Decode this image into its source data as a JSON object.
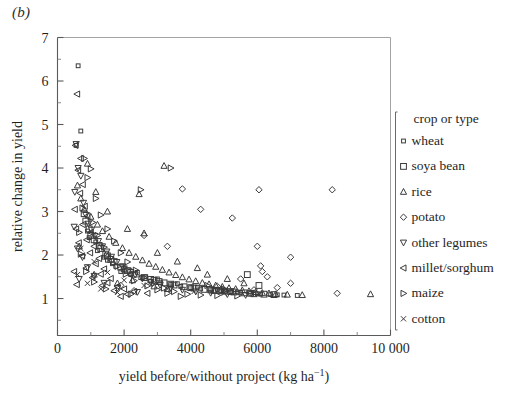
{
  "panel": {
    "label": "(b)"
  },
  "chart_data": {
    "type": "scatter",
    "title": "",
    "panel_label": "(b)",
    "xlabel": "yield before/without project (kg ha⁻¹)",
    "ylabel": "relative change in yield",
    "xlim": [
      0,
      10000
    ],
    "ylim": [
      0.15,
      7
    ],
    "grid": false,
    "legend_position": "right-outside",
    "legend_title": "crop or type",
    "x_ticks": [
      0,
      2000,
      4000,
      6000,
      8000,
      10000
    ],
    "x_tick_labels": [
      "0",
      "2000",
      "4000",
      "6000",
      "8000",
      "10 000"
    ],
    "x_minor_ticks": [
      1000,
      3000,
      5000,
      7000,
      9000
    ],
    "y_ticks": [
      1,
      2,
      3,
      4,
      5,
      6,
      7
    ],
    "y_tick_labels": [
      "1",
      "2",
      "3",
      "4",
      "5",
      "6",
      "7"
    ],
    "y_minor_ticks": [
      0.5,
      1.5,
      2.5,
      3.5,
      4.5,
      5.5,
      6.5
    ],
    "series": [
      {
        "name": "wheat",
        "marker": "small-square",
        "points": [
          [
            620,
            6.35
          ],
          [
            700,
            4.85
          ],
          [
            560,
            4.52
          ],
          [
            900,
            2.55
          ],
          [
            1150,
            2.3
          ],
          [
            1400,
            1.95
          ],
          [
            1650,
            1.8
          ],
          [
            1900,
            1.62
          ],
          [
            2200,
            1.55
          ],
          [
            2500,
            1.48
          ],
          [
            2800,
            1.4
          ],
          [
            3100,
            1.36
          ],
          [
            3400,
            1.32
          ],
          [
            3700,
            1.28
          ],
          [
            4000,
            1.25
          ],
          [
            4300,
            1.22
          ],
          [
            4600,
            1.2
          ],
          [
            4900,
            1.18
          ],
          [
            5200,
            1.16
          ],
          [
            5500,
            1.14
          ],
          [
            5800,
            1.12
          ],
          [
            6100,
            1.1
          ],
          [
            6400,
            1.09
          ],
          [
            6800,
            1.08
          ],
          [
            7200,
            1.07
          ],
          [
            2000,
            1.7
          ],
          [
            2400,
            1.6
          ],
          [
            3000,
            1.45
          ],
          [
            3600,
            1.34
          ],
          [
            4200,
            1.26
          ],
          [
            4800,
            1.21
          ],
          [
            5400,
            1.15
          ],
          [
            6000,
            1.11
          ],
          [
            1200,
            2.1
          ],
          [
            1500,
            1.88
          ],
          [
            950,
            2.4
          ],
          [
            1750,
            1.74
          ],
          [
            2650,
            1.5
          ],
          [
            5050,
            1.17
          ],
          [
            6600,
            1.085
          ]
        ]
      },
      {
        "name": "soya bean",
        "marker": "square",
        "points": [
          [
            800,
            2.95
          ],
          [
            950,
            2.6
          ],
          [
            1100,
            2.35
          ],
          [
            1300,
            2.15
          ],
          [
            1500,
            1.98
          ],
          [
            1700,
            1.85
          ],
          [
            1900,
            1.72
          ],
          [
            2100,
            1.64
          ],
          [
            2300,
            1.56
          ],
          [
            2600,
            1.48
          ],
          [
            2900,
            1.42
          ],
          [
            3200,
            1.36
          ],
          [
            3500,
            1.31
          ],
          [
            3800,
            1.27
          ],
          [
            4100,
            1.24
          ],
          [
            4400,
            1.21
          ],
          [
            4700,
            1.19
          ],
          [
            5000,
            1.17
          ],
          [
            5300,
            1.15
          ],
          [
            5600,
            1.13
          ],
          [
            5900,
            1.11
          ],
          [
            6200,
            1.1
          ],
          [
            6500,
            1.09
          ],
          [
            1000,
            2.45
          ],
          [
            1250,
            2.22
          ],
          [
            1600,
            1.9
          ],
          [
            2000,
            1.68
          ],
          [
            2800,
            1.44
          ],
          [
            3400,
            1.33
          ],
          [
            4000,
            1.25
          ],
          [
            4600,
            1.2
          ],
          [
            5200,
            1.16
          ],
          [
            5800,
            1.12
          ],
          [
            6050,
            1.3
          ],
          [
            5700,
            1.55
          ],
          [
            850,
            2.78
          ],
          [
            1450,
            2.02
          ],
          [
            2200,
            1.6
          ],
          [
            3050,
            1.39
          ],
          [
            4900,
            1.18
          ]
        ]
      },
      {
        "name": "rice",
        "marker": "triangle-up",
        "points": [
          [
            900,
            4.1
          ],
          [
            3200,
            4.05
          ],
          [
            1150,
            3.45
          ],
          [
            2450,
            3.4
          ],
          [
            700,
            3.3
          ],
          [
            800,
            3.05
          ],
          [
            1000,
            2.88
          ],
          [
            1200,
            2.7
          ],
          [
            1350,
            2.55
          ],
          [
            1550,
            2.42
          ],
          [
            1750,
            2.28
          ],
          [
            1950,
            2.16
          ],
          [
            2150,
            2.05
          ],
          [
            2350,
            1.96
          ],
          [
            2550,
            1.88
          ],
          [
            2750,
            1.8
          ],
          [
            2950,
            1.73
          ],
          [
            3150,
            1.66
          ],
          [
            3350,
            1.6
          ],
          [
            3550,
            1.54
          ],
          [
            3750,
            1.49
          ],
          [
            3950,
            1.44
          ],
          [
            4150,
            1.4
          ],
          [
            4350,
            1.36
          ],
          [
            4550,
            1.33
          ],
          [
            4750,
            1.3
          ],
          [
            4950,
            1.27
          ],
          [
            5150,
            1.24
          ],
          [
            5350,
            1.22
          ],
          [
            5550,
            1.19
          ],
          [
            5750,
            1.17
          ],
          [
            5950,
            1.15
          ],
          [
            6150,
            1.13
          ],
          [
            6350,
            1.12
          ],
          [
            6550,
            1.1
          ],
          [
            6900,
            1.09
          ],
          [
            7350,
            1.08
          ],
          [
            9400,
            1.1
          ],
          [
            2600,
            2.5
          ],
          [
            3000,
            2.05
          ],
          [
            3600,
            1.85
          ],
          [
            4200,
            1.7
          ],
          [
            1500,
            3.0
          ],
          [
            2100,
            2.6
          ],
          [
            4500,
            1.55
          ],
          [
            5100,
            1.45
          ],
          [
            5600,
            1.35
          ],
          [
            600,
            3.6
          ],
          [
            1800,
            1.35
          ],
          [
            2900,
            1.28
          ],
          [
            3300,
            1.22
          ],
          [
            4700,
            1.18
          ],
          [
            650,
            2.2
          ],
          [
            1100,
            1.55
          ],
          [
            2250,
            1.42
          ]
        ]
      },
      {
        "name": "potato",
        "marker": "diamond",
        "points": [
          [
            3750,
            3.52
          ],
          [
            6050,
            3.5
          ],
          [
            8250,
            3.5
          ],
          [
            4300,
            3.05
          ],
          [
            5250,
            2.85
          ],
          [
            2600,
            2.45
          ],
          [
            3300,
            2.2
          ],
          [
            6000,
            2.2
          ],
          [
            7000,
            1.95
          ],
          [
            6100,
            1.75
          ],
          [
            6150,
            1.62
          ],
          [
            5500,
            1.45
          ],
          [
            7000,
            1.35
          ],
          [
            6600,
            1.25
          ],
          [
            5900,
            1.2
          ],
          [
            8400,
            1.12
          ],
          [
            1900,
            1.3
          ],
          [
            2300,
            1.18
          ],
          [
            6300,
            1.5
          ],
          [
            4800,
            1.28
          ]
        ]
      },
      {
        "name": "other legumes",
        "marker": "triangle-down",
        "points": [
          [
            560,
            4.55
          ],
          [
            620,
            4.0
          ],
          [
            700,
            3.82
          ],
          [
            780,
            3.2
          ],
          [
            850,
            2.92
          ],
          [
            930,
            2.72
          ],
          [
            1020,
            2.58
          ],
          [
            1120,
            2.44
          ],
          [
            1230,
            2.32
          ],
          [
            1350,
            2.2
          ],
          [
            1480,
            2.08
          ],
          [
            1620,
            1.96
          ],
          [
            1780,
            1.84
          ],
          [
            1950,
            1.74
          ],
          [
            2130,
            1.64
          ],
          [
            2330,
            1.55
          ],
          [
            2550,
            1.46
          ],
          [
            2800,
            1.38
          ],
          [
            3080,
            1.31
          ],
          [
            3400,
            1.25
          ],
          [
            3750,
            1.2
          ],
          [
            4150,
            1.16
          ],
          [
            4600,
            1.13
          ],
          [
            5100,
            1.1
          ],
          [
            5650,
            1.08
          ],
          [
            600,
            2.15
          ],
          [
            750,
            1.95
          ],
          [
            900,
            1.72
          ],
          [
            1100,
            1.52
          ],
          [
            1400,
            1.36
          ],
          [
            1800,
            1.24
          ],
          [
            2400,
            1.15
          ],
          [
            650,
            1.45
          ],
          [
            500,
            2.65
          ],
          [
            520,
            3.45
          ]
        ]
      },
      {
        "name": "millet/sorghum",
        "marker": "triangle-left",
        "points": [
          [
            590,
            5.7
          ],
          [
            540,
            4.52
          ],
          [
            700,
            4.22
          ],
          [
            620,
            3.95
          ],
          [
            760,
            3.62
          ],
          [
            680,
            3.42
          ],
          [
            820,
            3.12
          ],
          [
            900,
            2.9
          ],
          [
            760,
            2.7
          ],
          [
            1000,
            2.52
          ],
          [
            880,
            2.35
          ],
          [
            1100,
            2.2
          ],
          [
            980,
            2.05
          ],
          [
            1250,
            1.92
          ],
          [
            1150,
            1.8
          ],
          [
            1400,
            1.68
          ],
          [
            1300,
            1.56
          ],
          [
            1600,
            1.46
          ],
          [
            1500,
            1.36
          ],
          [
            1800,
            1.28
          ],
          [
            2000,
            1.22
          ],
          [
            2300,
            1.16
          ],
          [
            2700,
            1.12
          ],
          [
            520,
            3.05
          ],
          [
            560,
            2.6
          ],
          [
            640,
            2.28
          ],
          [
            740,
            1.98
          ],
          [
            860,
            1.7
          ],
          [
            1050,
            1.48
          ],
          [
            1350,
            1.3
          ],
          [
            1700,
            1.18
          ],
          [
            2100,
            1.1
          ],
          [
            500,
            1.62
          ],
          [
            580,
            1.32
          ],
          [
            1900,
            1.05
          ]
        ]
      },
      {
        "name": "maize",
        "marker": "triangle-right",
        "points": [
          [
            800,
            4.22
          ],
          [
            3400,
            4.0
          ],
          [
            1000,
            3.98
          ],
          [
            2500,
            3.5
          ],
          [
            900,
            3.78
          ],
          [
            1150,
            3.3
          ],
          [
            750,
            3.08
          ],
          [
            1300,
            2.92
          ],
          [
            1050,
            2.75
          ],
          [
            1500,
            2.6
          ],
          [
            1200,
            2.45
          ],
          [
            1700,
            2.32
          ],
          [
            1400,
            2.18
          ],
          [
            1900,
            2.05
          ],
          [
            1600,
            1.94
          ],
          [
            2100,
            1.84
          ],
          [
            1800,
            1.74
          ],
          [
            2350,
            1.65
          ],
          [
            2050,
            1.56
          ],
          [
            2600,
            1.48
          ],
          [
            2300,
            1.41
          ],
          [
            2900,
            1.35
          ],
          [
            2700,
            1.29
          ],
          [
            3200,
            1.24
          ],
          [
            3000,
            1.2
          ],
          [
            3500,
            1.16
          ],
          [
            3300,
            1.12
          ],
          [
            3900,
            1.1
          ],
          [
            4300,
            1.08
          ],
          [
            4800,
            1.07
          ],
          [
            5400,
            1.06
          ],
          [
            650,
            2.52
          ],
          [
            700,
            2.02
          ],
          [
            860,
            1.62
          ],
          [
            1100,
            1.38
          ],
          [
            1450,
            1.22
          ],
          [
            2200,
            1.1
          ],
          [
            3700,
            1.05
          ],
          [
            4500,
            1.3
          ],
          [
            5000,
            1.22
          ]
        ]
      },
      {
        "name": "cotton",
        "marker": "cross-x",
        "points": [
          [
            700,
            2.15
          ],
          [
            1100,
            1.85
          ],
          [
            1500,
            1.6
          ],
          [
            2000,
            1.42
          ],
          [
            2600,
            1.3
          ],
          [
            3300,
            1.22
          ],
          [
            4100,
            1.16
          ],
          [
            5000,
            1.12
          ],
          [
            600,
            1.55
          ],
          [
            900,
            1.35
          ],
          [
            1300,
            1.22
          ],
          [
            1800,
            1.14
          ]
        ]
      }
    ]
  },
  "legend": {
    "title": "crop or type",
    "items": [
      {
        "label": "wheat",
        "marker": "small-square"
      },
      {
        "label": "soya bean",
        "marker": "square"
      },
      {
        "label": "rice",
        "marker": "triangle-up"
      },
      {
        "label": "potato",
        "marker": "diamond"
      },
      {
        "label": "other legumes",
        "marker": "triangle-down"
      },
      {
        "label": "millet/sorghum",
        "marker": "triangle-left"
      },
      {
        "label": "maize",
        "marker": "triangle-right"
      },
      {
        "label": "cotton",
        "marker": "cross-x"
      }
    ]
  },
  "axes": {
    "x_title": "yield before/without project (kg ha",
    "x_title_exp": "−1",
    "x_title_close": ")",
    "y_title": "relative change in yield",
    "x_labels": [
      "0",
      "2000",
      "4000",
      "6000",
      "8000",
      "10 000"
    ],
    "y_labels": [
      "1",
      "2",
      "3",
      "4",
      "5",
      "6",
      "7"
    ]
  }
}
